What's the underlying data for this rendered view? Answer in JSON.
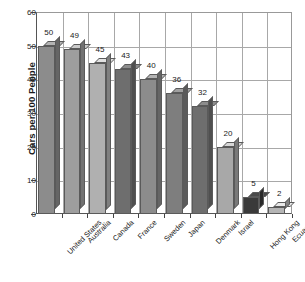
{
  "chart_data": {
    "type": "bar",
    "title": "",
    "subtitle": "",
    "xlabel": "",
    "ylabel": "Cars per 100 People",
    "categories": [
      "United States",
      "Australia",
      "Canada",
      "France",
      "Sweden",
      "Japan",
      "Denmark",
      "Israel",
      "Hong Kong",
      "Ecuador"
    ],
    "values": [
      50,
      49,
      45,
      43,
      40,
      36,
      32,
      20,
      5,
      2
    ],
    "value_labels": [
      "50",
      "49",
      "45",
      "43",
      "40",
      "36",
      "32",
      "20",
      "5",
      "2"
    ],
    "ylim": [
      0,
      60
    ],
    "ytick_values": [
      0,
      10,
      20,
      30,
      40,
      50,
      60
    ],
    "ytick_labels": [
      "0",
      "10",
      "20",
      "30",
      "40",
      "50",
      "60"
    ],
    "grid": "horizontal-and-vertical",
    "legend": "none",
    "bar_style": "3d-isometric",
    "bar_face_colors": [
      "#8c8c8c",
      "#9e9e9e",
      "#b0b0b0",
      "#6e6e6e",
      "#8c8c8c",
      "#7e7e7e",
      "#6e6e6e",
      "#a8a8a8",
      "#3a3a3a",
      "#b5b5b5"
    ],
    "annotations": []
  },
  "colors": {
    "background": "#ffffff",
    "grid": "#a8a8a8",
    "axis": "#555555",
    "text": "#1a1a1a",
    "bar_outline": "#5a5a5a"
  }
}
